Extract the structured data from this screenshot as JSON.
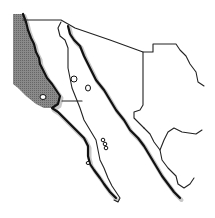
{
  "map": {
    "title": "",
    "region": "Northwestern Mexico outline map",
    "colors": {
      "background": "#ffffff",
      "ocean_highlight": "#7a7a7a",
      "border": "#222222",
      "coast": "#111111",
      "shadow": "#9a9a9a"
    },
    "features": [
      {
        "name": "pacific-ocean-shaded-area",
        "fill": "#7a7a7a"
      },
      {
        "name": "baja-california-peninsula"
      },
      {
        "name": "gulf-of-california"
      },
      {
        "name": "sonora"
      },
      {
        "name": "chihuahua"
      },
      {
        "name": "sinaloa"
      },
      {
        "name": "durango"
      },
      {
        "name": "islands"
      }
    ],
    "labels": []
  }
}
